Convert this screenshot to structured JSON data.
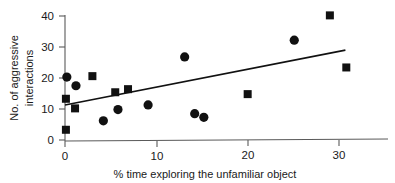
{
  "chart_data": {
    "type": "scatter",
    "title": "",
    "xlabel": "% time exploring the unfamiliar object",
    "ylabel": "No. of aggressive interactions",
    "ylabel_line1": "No. of aggressive",
    "ylabel_line2": "interactions",
    "xlim": [
      0,
      34
    ],
    "ylim": [
      0,
      42
    ],
    "xticks": [
      0,
      10,
      20,
      30
    ],
    "yticks": [
      0,
      10,
      20,
      30,
      40
    ],
    "xtick_labels": [
      "0",
      "10",
      "20",
      "30"
    ],
    "ytick_labels": [
      "0",
      "10",
      "20",
      "30",
      "40"
    ],
    "grid": false,
    "legend": "none",
    "marker_color": "#111111",
    "axis_color": "#5a5a5a",
    "series": [
      {
        "name": "circles",
        "marker": "circle",
        "points": [
          [
            0.2,
            20.3
          ],
          [
            1.2,
            17.5
          ],
          [
            4.2,
            6.2
          ],
          [
            5.8,
            9.8
          ],
          [
            9.1,
            11.3
          ],
          [
            13.1,
            26.8
          ],
          [
            14.2,
            8.5
          ],
          [
            15.2,
            7.3
          ],
          [
            25.1,
            32.2
          ]
        ]
      },
      {
        "name": "squares",
        "marker": "square",
        "points": [
          [
            0.1,
            13.3
          ],
          [
            0.1,
            3.3
          ],
          [
            1.1,
            10.2
          ],
          [
            3.0,
            20.6
          ],
          [
            5.5,
            15.4
          ],
          [
            6.9,
            16.4
          ],
          [
            20.0,
            14.8
          ],
          [
            29.0,
            40.2
          ],
          [
            30.8,
            23.4
          ]
        ]
      }
    ],
    "trend_line": {
      "name": "regression-line",
      "x_start": 0.0,
      "y_start": 11.3,
      "x_end": 30.7,
      "y_end": 29.0
    }
  }
}
